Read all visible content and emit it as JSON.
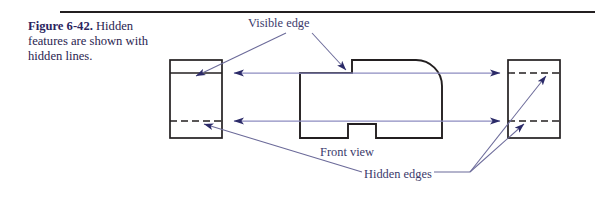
{
  "figure": {
    "number": "Figure 6-42.",
    "caption": "Hidden features are shown with hidden lines."
  },
  "labels": {
    "visible_edge": "Visible edge",
    "front_view": "Front view",
    "hidden_edges": "Hidden edges"
  },
  "colors": {
    "annotation": "#3b3a6b",
    "caption_heading": "#2b2560",
    "caption_body": "#2a2550",
    "object_line": "#231f20",
    "rule": "#231f20",
    "projection_line": "#8d8cc0",
    "arrowhead": "#2b2a68",
    "leader_line": "#6b6a99"
  },
  "drawing": {
    "side_view_left": {
      "x": 170,
      "y": 60,
      "width": 52,
      "height": 78,
      "visible_edge_y": 73,
      "hidden_edge_y": 121
    },
    "side_view_right": {
      "x": 508,
      "y": 60,
      "width": 52,
      "height": 78,
      "hidden_edge_top_y": 73,
      "hidden_edge_bottom_y": 121
    },
    "front_view": {
      "x": 300,
      "y": 60,
      "width": 142,
      "height": 78,
      "notch": {
        "x": 348,
        "width": 28,
        "depth": 14
      },
      "step": {
        "x": 352,
        "height": 13
      },
      "corner_radius": 26
    },
    "projection_lines": [
      {
        "name": "upper",
        "y": 73,
        "x1": 232,
        "x2": 500
      },
      {
        "name": "lower",
        "y": 121,
        "x1": 232,
        "x2": 500
      }
    ]
  }
}
